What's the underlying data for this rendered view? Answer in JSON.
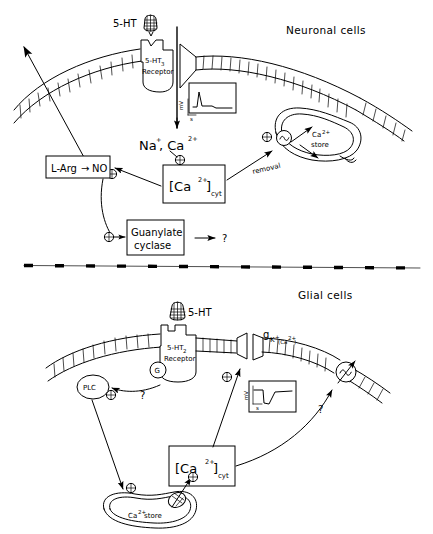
{
  "figure": {
    "type": "biological-signalling-diagram",
    "background": "#ffffff",
    "ink_color": "#000000",
    "panels": [
      {
        "id": "neuronal",
        "title": "Neuronal cells",
        "ligand_label": "5-HT",
        "receptor_label_line1": "5-HT",
        "receptor_label_sub": "3",
        "receptor_label_line2": "Receptor",
        "ions_label": "Na",
        "ions_sup1": "+",
        "ions_label2": ", Ca",
        "ions_sup2": "2+",
        "calcium_box": "[Ca",
        "calcium_box_sup": "2+",
        "calcium_box_mid": "]",
        "calcium_box_sub": "cyt",
        "store_label_line1": "Ca",
        "store_label_sup": "2+",
        "store_label_line2": "store",
        "removal_label": "removal",
        "pump_glyph": "~",
        "plus_glyph": "⊕",
        "larg_box": "L-Arg",
        "larg_arrow": "→",
        "larg_product": "NO",
        "guanylate_line1": "Guanylate",
        "guanylate_line2": "cyclase",
        "question_mark": "?",
        "inset_ylabel": "mV",
        "inset_xlabel": "s",
        "inset_trace": "depolarization-spike"
      },
      {
        "id": "glial",
        "title": "Glial cells",
        "ligand_label": "5-HT",
        "receptor_label_line1": "5-HT",
        "receptor_label_sub": "2",
        "receptor_label_line2": "Receptor",
        "gprotein_label": "G",
        "plc_label": "PLC",
        "channel_label": "g",
        "channel_sub": "K",
        "channel_sub_sup": "+",
        "channel_sub2": "(Ca",
        "channel_sub2_sup": "2+",
        "channel_sub2_close": ")",
        "calcium_box": "[Ca",
        "calcium_box_sup": "2+",
        "calcium_box_mid": "]",
        "calcium_box_sub": "cyt",
        "store_label_line1": "Ca",
        "store_label_sup": "2+",
        "store_label_line2": "store",
        "pump_glyph": "~",
        "plus_glyph": "⊕",
        "question_mark": "?",
        "inset_ylabel": "mV",
        "inset_xlabel": "s",
        "inset_trace": "hyperpolarization-dip"
      }
    ],
    "divider": {
      "style": "dashed-line"
    }
  }
}
